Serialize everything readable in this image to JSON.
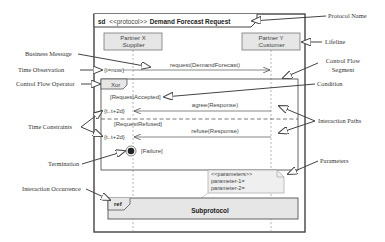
{
  "frame": {
    "keyword": "sd",
    "stereotype": "<<protocol>>",
    "name": "Demand Forecast Request"
  },
  "lifelines": [
    {
      "line1": "Partner X",
      "line2": ":Supplier"
    },
    {
      "line1": "Partner Y",
      "line2": ":Customer"
    }
  ],
  "time_observation": "{t=now}",
  "messages": {
    "request": "request(DemandForecast)",
    "agree": "agree(Response)",
    "refuse": "refuse(Response)"
  },
  "fragment": {
    "operator": "Xor",
    "guard1": "[RequestAccepted]",
    "guard2": "[RequestRefused]"
  },
  "time_constraints": [
    "{t..t+2d}",
    "{t..t+2d}"
  ],
  "termination_label": "[Failure]",
  "parameters_note": {
    "stereotype": "<<parameters>>",
    "param1": "parameter-1=",
    "param2": "parameter-2="
  },
  "ref": {
    "label": "ref",
    "name": "Subprotocol"
  },
  "annotations": {
    "protocol_name": "Protocol Name",
    "lifeline": "Lifeline",
    "business_message": "Business Message",
    "time_observation": "Time Observation",
    "control_flow_segment_1": "Control Flow",
    "control_flow_segment_2": "Segment",
    "control_flow_operator": "Control Flow Operator",
    "condition": "Condition",
    "time_constraints": "Time Constraints",
    "interaction_paths": "Interaction Paths",
    "termination": "Termination",
    "parameters": "Parameters",
    "interaction_occurrence": "Interaction Occurrence"
  },
  "colors": {
    "frame_stroke": "#444444",
    "box_fill": "#e6e6e6",
    "line": "#555555"
  }
}
